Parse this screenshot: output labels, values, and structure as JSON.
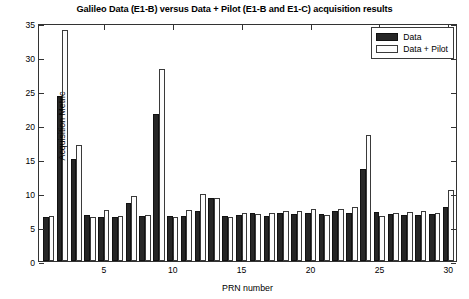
{
  "chart_data": {
    "type": "bar",
    "title": "Galileo Data (E1-B) versus Data + Pilot (E1-B and E1-C) acquisition results",
    "xlabel": "PRN number",
    "ylabel": "Acquisition Metric",
    "xlim": [
      0.3,
      30.7
    ],
    "ylim": [
      0,
      35
    ],
    "yticks": [
      0,
      5,
      10,
      15,
      20,
      25,
      30,
      35
    ],
    "xticks": [
      5,
      10,
      15,
      20,
      25,
      30
    ],
    "grid": false,
    "legend_position": "top-right",
    "categories": [
      1,
      2,
      3,
      4,
      5,
      6,
      7,
      8,
      9,
      10,
      11,
      12,
      13,
      14,
      15,
      16,
      17,
      18,
      19,
      20,
      21,
      22,
      23,
      24,
      25,
      26,
      27,
      28,
      29,
      30
    ],
    "series": [
      {
        "name": "Data",
        "color": "#262626",
        "values": [
          6.5,
          24.2,
          15.0,
          6.8,
          6.5,
          6.5,
          8.5,
          6.6,
          21.6,
          6.6,
          6.6,
          7.3,
          9.2,
          6.6,
          6.8,
          7.1,
          6.6,
          7.0,
          6.9,
          7.0,
          6.9,
          7.3,
          7.1,
          13.6,
          7.2,
          6.9,
          6.8,
          6.8,
          6.9,
          8.0
        ]
      },
      {
        "name": "Data + Pilot",
        "color": "#fcfcfc",
        "values": [
          6.6,
          34.0,
          17.0,
          6.5,
          7.5,
          6.6,
          9.5,
          6.7,
          28.2,
          6.4,
          7.5,
          9.9,
          9.3,
          6.5,
          7.0,
          6.9,
          7.0,
          7.4,
          7.3,
          7.6,
          6.7,
          7.6,
          8.0,
          18.5,
          6.6,
          7.0,
          7.2,
          7.4,
          7.0,
          10.5
        ]
      }
    ]
  },
  "legend": {
    "entries": [
      {
        "label": "Data"
      },
      {
        "label": "Data + Pilot"
      }
    ]
  }
}
